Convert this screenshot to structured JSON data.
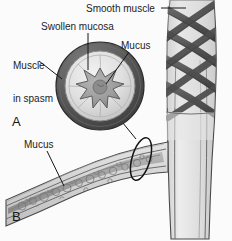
{
  "figure": {
    "width": 232,
    "height": 241,
    "background_color": "#fbfbfb",
    "style": "grayscale medical illustration"
  },
  "labels": {
    "smooth_muscle": "Smooth muscle",
    "swollen_mucosa": "Swollen mucosa",
    "muscle_in_spasm_line1": "Muscle",
    "muscle_in_spasm_line2": "in spasm",
    "mucus_top": "Mucus",
    "mucus_bottom": "Mucus"
  },
  "panels": {
    "a": {
      "letter": "A",
      "description": "Cross-section of a constricted bronchiole showing muscle in spasm, swollen mucosa and a central mucus plug"
    },
    "b": {
      "letter": "B",
      "description": "Longitudinal view of a bronchiole branching from the airway trunk with mucus filling the lumen"
    }
  },
  "colors": {
    "outline": "#3a3a3a",
    "muscle_dark": "#5d5d5d",
    "muscle_darker": "#4a4a4a",
    "mucosa_mid": "#9a9a9a",
    "lumen_light": "#e3e3e3",
    "mucus_fill": "#a8a8a8",
    "tissue_light": "#d6d6d6",
    "tissue_lighter": "#e8e8e8",
    "label_text": "#1d1d1d"
  },
  "leader_lines": {
    "smooth_muscle": "horizontal line from label right edge to the braided muscle bands on the airway trunk",
    "swollen_mucosa": "vertical line descending into the pale mucosa ring of the cross-section",
    "muscle_in_spasm": "diagonal line descending right to the dark outer muscle ring",
    "mucus_top": "diagonal line descending left into the star-shaped central mucus plug",
    "mucus_bottom": "diagonal line descending right into the granular mucus band in the branch lumen",
    "callout": "line from the ellipse marking the branch constriction up to the circular cross-section inset"
  }
}
